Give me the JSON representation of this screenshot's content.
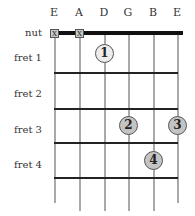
{
  "diagram": {
    "strings": [
      "E",
      "A",
      "D",
      "G",
      "B",
      "E"
    ],
    "row_labels": [
      "nut",
      "fret 1",
      "fret 2",
      "fret 3",
      "fret 4"
    ],
    "muted_strings": [
      {
        "string": "E",
        "symbol": "X"
      },
      {
        "string": "A",
        "symbol": "X"
      }
    ],
    "fingers": [
      {
        "finger": "1",
        "string": "D",
        "fret": 1
      },
      {
        "finger": "2",
        "string": "G",
        "fret": 3
      },
      {
        "finger": "3",
        "string": "E",
        "fret": 3
      },
      {
        "finger": "4",
        "string": "B",
        "fret": 4
      }
    ]
  }
}
